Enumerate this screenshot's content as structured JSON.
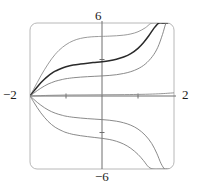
{
  "figure": {
    "kind": "solution-curves-plot",
    "background": "#ffffff",
    "width": 200,
    "height": 195
  },
  "labels": {
    "top": "6",
    "bottom": "−6",
    "left": "−2",
    "right": "2"
  },
  "chart_data": {
    "type": "line",
    "title": "",
    "subtitle": "",
    "xlabel": "",
    "ylabel": "",
    "xlim": [
      -2,
      2
    ],
    "ylim": [
      -6,
      6
    ],
    "xticks": [
      -1,
      0,
      1
    ],
    "yticks": [
      -3,
      0,
      3
    ],
    "xtick_labels": [
      "-2",
      "2"
    ],
    "ytick_labels": [
      "6",
      "-6"
    ],
    "grid": false,
    "legend": false,
    "legend_position": "none",
    "axes_drawn": [
      "x-axis",
      "y-axis"
    ],
    "frame": "rounded-rectangle",
    "annotations": [
      {
        "text": "6",
        "position": "top-of-y-axis"
      },
      {
        "text": "-6",
        "position": "bottom-of-y-axis"
      },
      {
        "text": "-2",
        "position": "left-of-x-axis"
      },
      {
        "text": "2",
        "position": "right-of-x-axis"
      }
    ],
    "common_point": [
      -2,
      0
    ],
    "series": [
      {
        "name": "curve-1-upper-outer",
        "color": "#8f8f8f",
        "width": 0.9,
        "x": [
          -2.0,
          -1.9,
          -1.8,
          -1.7,
          -1.6,
          -1.5,
          -1.4,
          -1.3,
          -1.2,
          -1.1,
          -1.0,
          -0.9,
          -0.8,
          -0.7,
          -0.6,
          -0.5,
          -0.4,
          -0.3,
          -0.2,
          -0.1,
          0.0,
          0.2,
          0.4,
          0.6,
          0.8,
          1.0,
          1.2,
          1.35,
          1.48,
          1.58,
          1.65,
          1.7
        ],
        "y": [
          0.0,
          0.55,
          1.1,
          1.65,
          2.15,
          2.62,
          3.05,
          3.42,
          3.74,
          4.0,
          4.22,
          4.4,
          4.54,
          4.65,
          4.73,
          4.79,
          4.83,
          4.86,
          4.88,
          4.89,
          4.9,
          4.92,
          4.95,
          5.0,
          5.1,
          5.28,
          5.6,
          5.95,
          6.0,
          6.0,
          6.0,
          6.0
        ]
      },
      {
        "name": "curve-2-upper-bold",
        "color": "#2a2a2a",
        "width": 1.5,
        "x": [
          -2.0,
          -1.9,
          -1.8,
          -1.7,
          -1.6,
          -1.5,
          -1.4,
          -1.3,
          -1.2,
          -1.1,
          -1.0,
          -0.8,
          -0.6,
          -0.4,
          -0.2,
          0.0,
          0.2,
          0.4,
          0.6,
          0.8,
          1.0,
          1.15,
          1.3,
          1.45,
          1.58,
          1.68,
          1.76,
          1.82
        ],
        "y": [
          0.0,
          0.38,
          0.74,
          1.08,
          1.38,
          1.64,
          1.86,
          2.04,
          2.18,
          2.3,
          2.4,
          2.54,
          2.63,
          2.7,
          2.76,
          2.82,
          2.9,
          3.02,
          3.2,
          3.48,
          3.92,
          4.38,
          4.95,
          5.6,
          6.0,
          6.0,
          6.0,
          6.0
        ]
      },
      {
        "name": "curve-3-upper-inner",
        "color": "#7d7d7d",
        "width": 0.9,
        "x": [
          -2.0,
          -1.9,
          -1.8,
          -1.7,
          -1.6,
          -1.5,
          -1.4,
          -1.3,
          -1.2,
          -1.1,
          -1.0,
          -0.8,
          -0.6,
          -0.4,
          -0.2,
          0.0,
          0.2,
          0.4,
          0.6,
          0.8,
          1.0,
          1.2,
          1.4,
          1.55,
          1.68,
          1.78,
          1.86,
          1.92
        ],
        "y": [
          0.0,
          0.22,
          0.44,
          0.64,
          0.82,
          0.98,
          1.1,
          1.21,
          1.29,
          1.36,
          1.42,
          1.5,
          1.55,
          1.59,
          1.62,
          1.65,
          1.69,
          1.75,
          1.85,
          2.0,
          2.24,
          2.62,
          3.25,
          4.0,
          5.05,
          6.0,
          6.0,
          6.0
        ]
      },
      {
        "name": "curve-4-lower-inner",
        "color": "#7d7d7d",
        "width": 0.9,
        "x": [
          -2.0,
          -1.9,
          -1.8,
          -1.7,
          -1.6,
          -1.5,
          -1.4,
          -1.3,
          -1.2,
          -1.1,
          -1.0,
          -0.8,
          -0.6,
          -0.4,
          -0.2,
          0.0,
          0.2,
          0.4,
          0.6,
          0.8,
          1.0,
          1.2,
          1.38,
          1.52,
          1.64,
          1.74,
          1.82,
          1.88
        ],
        "y": [
          0.0,
          -0.26,
          -0.52,
          -0.75,
          -0.96,
          -1.14,
          -1.29,
          -1.41,
          -1.51,
          -1.59,
          -1.66,
          -1.75,
          -1.81,
          -1.86,
          -1.9,
          -1.94,
          -1.99,
          -2.07,
          -2.2,
          -2.4,
          -2.72,
          -3.22,
          -3.9,
          -4.7,
          -5.55,
          -6.0,
          -6.0,
          -6.0
        ]
      },
      {
        "name": "curve-5-lower-outer",
        "color": "#7d7d7d",
        "width": 0.9,
        "x": [
          -2.0,
          -1.9,
          -1.8,
          -1.7,
          -1.6,
          -1.5,
          -1.4,
          -1.3,
          -1.2,
          -1.1,
          -1.0,
          -0.8,
          -0.6,
          -0.4,
          -0.2,
          0.0,
          0.2,
          0.4,
          0.6,
          0.8,
          1.0,
          1.15,
          1.3,
          1.44,
          1.56,
          1.66,
          1.74,
          1.8
        ],
        "y": [
          0.0,
          -0.48,
          -0.95,
          -1.38,
          -1.75,
          -2.08,
          -2.35,
          -2.57,
          -2.74,
          -2.88,
          -3.0,
          -3.16,
          -3.26,
          -3.34,
          -3.41,
          -3.48,
          -3.57,
          -3.72,
          -3.95,
          -4.3,
          -4.8,
          -5.3,
          -5.85,
          -6.0,
          -6.0,
          -6.0,
          -6.0,
          -6.0
        ]
      },
      {
        "name": "curve-6-equilibrium",
        "color": "#8a8a8a",
        "width": 0.9,
        "x": [
          -2.0,
          -1.5,
          -1.0,
          -0.5,
          0.0,
          0.5,
          1.0,
          1.4,
          1.7,
          1.9,
          2.0
        ],
        "y": [
          0.0,
          0.05,
          0.08,
          0.09,
          0.1,
          0.11,
          0.13,
          0.16,
          0.2,
          0.24,
          0.26
        ]
      }
    ]
  },
  "style": {
    "frame_color": "#b8b8b8",
    "axis_color": "#6e6e6e",
    "text_color": "#1b1b1b"
  }
}
